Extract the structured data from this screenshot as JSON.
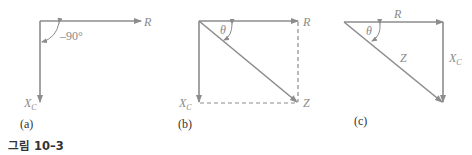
{
  "figure": {
    "caption": "그림 10–3",
    "panels": [
      {
        "id": "a",
        "label": "(a)",
        "vectors": [
          "R",
          "X_C"
        ],
        "angle_label": "–90°",
        "R_label": "R",
        "XC_label": "X",
        "XC_sub": "C"
      },
      {
        "id": "b",
        "label": "(b)",
        "vectors": [
          "R",
          "X_C",
          "Z"
        ],
        "angle_label": "θ",
        "R_label": "R",
        "XC_label": "X",
        "XC_sub": "C",
        "Z_label": "Z"
      },
      {
        "id": "c",
        "label": "(c)",
        "vectors": [
          "R",
          "X_C",
          "Z"
        ],
        "angle_label": "θ",
        "R_label": "R",
        "XC_label": "X",
        "XC_sub": "C",
        "Z_label": "Z"
      }
    ],
    "colors": {
      "line": "#8c8c8c",
      "text": "#8a8a8a",
      "caption": "#333333"
    }
  }
}
